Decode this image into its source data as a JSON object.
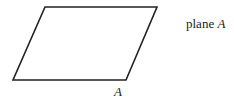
{
  "diagram": {
    "shape": "parallelogram",
    "vertices": [
      [
        45,
        7
      ],
      [
        157,
        7
      ],
      [
        126,
        80
      ],
      [
        13,
        80
      ]
    ],
    "stroke_color": "#222222",
    "vertex_label": "A",
    "caption_word": "plane",
    "caption_var": "A"
  }
}
